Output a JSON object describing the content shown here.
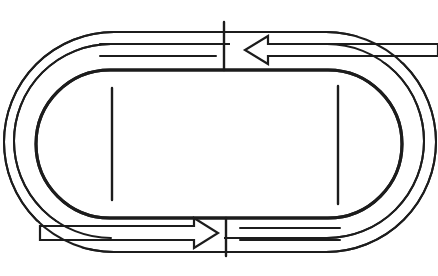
{
  "diagram": {
    "type": "race-track-schematic",
    "colors": {
      "stroke": "#1c1c1c",
      "background": "#ffffff"
    },
    "tracks": [
      {
        "name": "outer-lane",
        "x": 4,
        "y": 32,
        "width": 432,
        "height": 220,
        "stroke_width": 2
      },
      {
        "name": "middle-lane",
        "x": 14,
        "y": 44,
        "width": 410,
        "height": 194,
        "stroke_width": 2
      },
      {
        "name": "inner-lane",
        "x": 36,
        "y": 70,
        "width": 366,
        "height": 148,
        "stroke_width": 3
      }
    ],
    "marks": [
      {
        "name": "left-straight-mark",
        "x": 112,
        "y1": 88,
        "y2": 200
      },
      {
        "name": "right-straight-mark",
        "x": 338,
        "y1": 86,
        "y2": 204
      }
    ],
    "dividers": [
      {
        "name": "top-divider",
        "x": 224,
        "y1": 22,
        "y2": 70
      },
      {
        "name": "bottom-divider",
        "x": 226,
        "y1": 218,
        "y2": 256
      }
    ],
    "arrows": [
      {
        "name": "top-arrow",
        "direction": "left"
      },
      {
        "name": "bottom-arrow",
        "direction": "right"
      }
    ]
  }
}
